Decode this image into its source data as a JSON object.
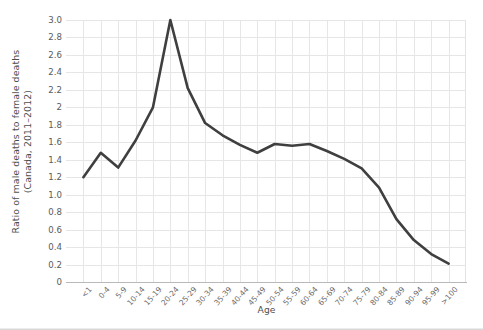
{
  "chart_data": {
    "type": "line",
    "title": "",
    "xlabel": "Age",
    "ylabel": "Ratio of male deaths to female deaths\n(Canada, 2011–2012)",
    "ylim": [
      0,
      3.0
    ],
    "ytick_step": 0.2,
    "grid": true,
    "legend": "none",
    "line_color": "#3f3f3f",
    "line_width": 2.6,
    "grid_color": "#e6e6e6",
    "axis_color": "#b9b9b9",
    "categories": [
      "<1",
      "0-4",
      "5-9",
      "10-14",
      "15-19",
      "20-24",
      "25-29",
      "30-34",
      "35-39",
      "40-44",
      "45-49",
      "50-54",
      "55-59",
      "60-64",
      "65-69",
      "70-74",
      "75-79",
      "80-84",
      "85-89",
      "90-94",
      "95-99",
      ">100"
    ],
    "values": [
      1.2,
      1.48,
      1.31,
      1.62,
      2.0,
      3.0,
      2.22,
      1.82,
      1.68,
      1.57,
      1.48,
      1.58,
      1.56,
      1.58,
      1.5,
      1.41,
      1.3,
      1.08,
      0.72,
      0.48,
      0.32,
      0.21
    ],
    "yticks": [
      "0",
      "0.2",
      "0.4",
      "0.6",
      "0.8",
      "1.0",
      "1.2",
      "1.4",
      "1.6",
      "1.8",
      "2",
      "2.2",
      "2.4",
      "2.6",
      "2.8",
      "3.0"
    ],
    "ytick_values": [
      0,
      0.2,
      0.4,
      0.6,
      0.8,
      1.0,
      1.2,
      1.4,
      1.6,
      1.8,
      2.0,
      2.2,
      2.4,
      2.6,
      2.8,
      3.0
    ]
  }
}
